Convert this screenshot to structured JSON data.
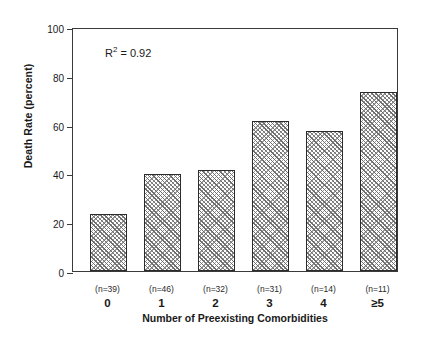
{
  "chart_data": {
    "type": "bar",
    "title": "",
    "xlabel": "Number of Preexisting Comorbidities",
    "ylabel": "Death Rate (percent)",
    "categories": [
      "0",
      "1",
      "2",
      "3",
      "4",
      "≥5"
    ],
    "values": [
      23.3,
      39.8,
      41.2,
      61.5,
      57.3,
      73.2
    ],
    "sample_sizes": [
      "(n=39)",
      "(n=46)",
      "(n=32)",
      "(n=31)",
      "(n=14)",
      "(n=11)"
    ],
    "annotation": {
      "text": "R2 = 0.92",
      "r_symbol": "R",
      "exponent": "2",
      "equals_value": "= 0.92"
    },
    "ylim": [
      0,
      100
    ],
    "yticks": [
      0,
      20,
      40,
      60,
      80,
      100
    ],
    "ytick_labels": [
      "0",
      "20",
      "40",
      "60",
      "80",
      "100"
    ],
    "grid": false,
    "legend": false,
    "bar_fill": "#ffffff",
    "bar_edge": "#2b2b2b",
    "hatch": "crosshatch-diagonal",
    "axis_color": "#3a3a3a",
    "background": "#ffffff"
  }
}
